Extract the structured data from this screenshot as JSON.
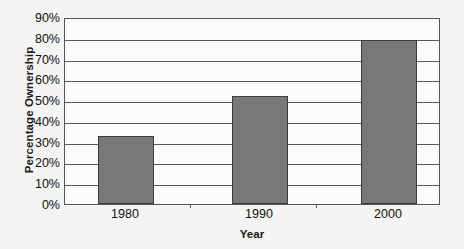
{
  "chart_data": {
    "type": "bar",
    "title": "",
    "categories": [
      "1980",
      "1990",
      "2000"
    ],
    "values": [
      33,
      52.5,
      80
    ],
    "value_unit": "%",
    "xlabel": "Year",
    "ylabel": "Percentage Ownership",
    "ylim": [
      0,
      90
    ],
    "ytick_labels": [
      "90%",
      "80%",
      "70%",
      "60%",
      "50%",
      "40%",
      "30%",
      "20%",
      "10%",
      "0%"
    ],
    "ytick_values": [
      90,
      80,
      70,
      60,
      50,
      40,
      30,
      20,
      10,
      0
    ],
    "ytick_step": 10,
    "grid": true,
    "grid_axis": "y",
    "legend": false,
    "legend_position": "none",
    "series": [
      {
        "name": "Percentage Ownership",
        "values": [
          33,
          52.5,
          80
        ],
        "color": "#787878",
        "border_color": "#3c3c3c"
      }
    ],
    "colors": {
      "bar_fill": "#787878",
      "bar_border": "#3c3c3c",
      "gridline": "#5a5a5a",
      "plot_background": "#fbfbfb",
      "page_background": "#f4f4f4",
      "axis_text": "#111111",
      "axis_title": "#1a1a1a"
    }
  }
}
